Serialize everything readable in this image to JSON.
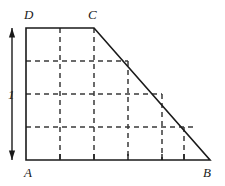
{
  "figure": {
    "background_color": "#ffffff",
    "stroke_color": "#1a1a1a",
    "dash_color": "#3a3a3a",
    "width": 225,
    "height": 186
  },
  "vertices": {
    "A": {
      "label": "A",
      "x": 26,
      "y": 160,
      "label_x": 24,
      "label_y": 166
    },
    "B": {
      "label": "B",
      "x": 210,
      "y": 160,
      "label_x": 203,
      "label_y": 166
    },
    "C": {
      "label": "C",
      "x": 94,
      "y": 28,
      "label_x": 88,
      "label_y": 8
    },
    "D": {
      "label": "D",
      "x": 26,
      "y": 28,
      "label_x": 24,
      "label_y": 8
    }
  },
  "outline": {
    "name": "trapezoid-outline",
    "points": "26,28 94,28 210,160 26,160",
    "closed": true,
    "stroke_width": 1.6
  },
  "grid": {
    "spacing": 34,
    "row_spacing": 33,
    "dash_pattern": "5,4",
    "stroke_width": 1.5,
    "vertical_lines": [
      {
        "name": "grid-vline-1",
        "x": 60,
        "y1": 28,
        "y2": 160
      },
      {
        "name": "grid-vline-2",
        "x": 94,
        "y1": 28,
        "y2": 160
      },
      {
        "name": "grid-vline-3",
        "x": 128,
        "y1": 61,
        "y2": 160
      },
      {
        "name": "grid-vline-4",
        "x": 162,
        "y1": 94,
        "y2": 160
      },
      {
        "name": "grid-vline-5",
        "x": 184,
        "y1": 127,
        "y2": 160
      }
    ],
    "horizontal_lines": [
      {
        "name": "grid-hline-1",
        "y": 61,
        "x1": 26,
        "x2": 128
      },
      {
        "name": "grid-hline-2",
        "y": 94,
        "x1": 26,
        "x2": 162
      },
      {
        "name": "grid-hline-3",
        "y": 127,
        "x1": 26,
        "x2": 196
      }
    ]
  },
  "bottom_ticks": {
    "name": "baseline-ticks",
    "y_top": 154,
    "y_bottom": 160,
    "x_values": [
      60,
      94,
      128,
      162,
      184
    ]
  },
  "dimension": {
    "name": "height-dimension",
    "label": "1",
    "x": 12,
    "y_top": 28,
    "y_bottom": 160,
    "label_x": 8,
    "label_y": 88,
    "arrow_head_size": 5,
    "stroke_width": 1.4
  }
}
